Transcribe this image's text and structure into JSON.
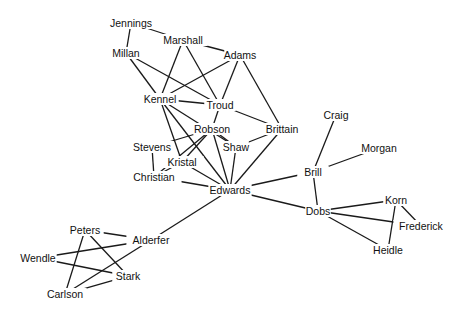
{
  "diagram": {
    "type": "social-network-graph",
    "nodes": [
      {
        "id": "Jennings",
        "label": "Jennings",
        "x": 131,
        "y": 23
      },
      {
        "id": "Marshall",
        "label": "Marshall",
        "x": 183,
        "y": 40
      },
      {
        "id": "Millan",
        "label": "Millan",
        "x": 126,
        "y": 53
      },
      {
        "id": "Adams",
        "label": "Adams",
        "x": 240,
        "y": 55
      },
      {
        "id": "Kennel",
        "label": "Kennel",
        "x": 160,
        "y": 99
      },
      {
        "id": "Troud",
        "label": "Troud",
        "x": 220,
        "y": 105
      },
      {
        "id": "Robson",
        "label": "Robson",
        "x": 212,
        "y": 129
      },
      {
        "id": "Brittain",
        "label": "Brittain",
        "x": 282,
        "y": 129
      },
      {
        "id": "Stevens",
        "label": "Stevens",
        "x": 152,
        "y": 147
      },
      {
        "id": "Shaw",
        "label": "Shaw",
        "x": 236,
        "y": 147
      },
      {
        "id": "Kristal",
        "label": "Kristal",
        "x": 182,
        "y": 162
      },
      {
        "id": "Christian",
        "label": "Christian",
        "x": 154,
        "y": 177
      },
      {
        "id": "Edwards",
        "label": "Edwards",
        "x": 230,
        "y": 190
      },
      {
        "id": "Craig",
        "label": "Craig",
        "x": 336,
        "y": 115
      },
      {
        "id": "Morgan",
        "label": "Morgan",
        "x": 379,
        "y": 148
      },
      {
        "id": "Brill",
        "label": "Brill",
        "x": 313,
        "y": 172
      },
      {
        "id": "Dobs",
        "label": "Dobs",
        "x": 318,
        "y": 211
      },
      {
        "id": "Korn",
        "label": "Korn",
        "x": 396,
        "y": 200
      },
      {
        "id": "Frederick",
        "label": "Frederick",
        "x": 421,
        "y": 226
      },
      {
        "id": "Heidle",
        "label": "Heidle",
        "x": 388,
        "y": 250
      },
      {
        "id": "Peters",
        "label": "Peters",
        "x": 85,
        "y": 230
      },
      {
        "id": "Alderfer",
        "label": "Alderfer",
        "x": 151,
        "y": 240
      },
      {
        "id": "Wendle",
        "label": "Wendle",
        "x": 38,
        "y": 258
      },
      {
        "id": "Stark",
        "label": "Stark",
        "x": 128,
        "y": 276
      },
      {
        "id": "Carlson",
        "label": "Carlson",
        "x": 65,
        "y": 294
      }
    ],
    "edges": [
      [
        "Jennings",
        "Marshall"
      ],
      [
        "Jennings",
        "Millan"
      ],
      [
        "Marshall",
        "Adams"
      ],
      [
        "Marshall",
        "Kennel"
      ],
      [
        "Marshall",
        "Troud"
      ],
      [
        "Millan",
        "Kennel"
      ],
      [
        "Millan",
        "Troud"
      ],
      [
        "Adams",
        "Kennel"
      ],
      [
        "Adams",
        "Troud"
      ],
      [
        "Adams",
        "Brittain"
      ],
      [
        "Kennel",
        "Troud"
      ],
      [
        "Kennel",
        "Kristal"
      ],
      [
        "Kennel",
        "Edwards"
      ],
      [
        "Kennel",
        "Shaw"
      ],
      [
        "Troud",
        "Robson"
      ],
      [
        "Troud",
        "Brittain"
      ],
      [
        "Robson",
        "Stevens"
      ],
      [
        "Robson",
        "Christian"
      ],
      [
        "Robson",
        "Kristal"
      ],
      [
        "Robson",
        "Shaw"
      ],
      [
        "Robson",
        "Edwards"
      ],
      [
        "Brittain",
        "Shaw"
      ],
      [
        "Brittain",
        "Edwards"
      ],
      [
        "Stevens",
        "Christian"
      ],
      [
        "Shaw",
        "Edwards"
      ],
      [
        "Kristal",
        "Christian"
      ],
      [
        "Kristal",
        "Edwards"
      ],
      [
        "Christian",
        "Edwards"
      ],
      [
        "Edwards",
        "Brill"
      ],
      [
        "Edwards",
        "Dobs"
      ],
      [
        "Edwards",
        "Alderfer"
      ],
      [
        "Brill",
        "Craig"
      ],
      [
        "Brill",
        "Morgan"
      ],
      [
        "Brill",
        "Dobs"
      ],
      [
        "Dobs",
        "Korn"
      ],
      [
        "Dobs",
        "Frederick"
      ],
      [
        "Dobs",
        "Heidle"
      ],
      [
        "Korn",
        "Frederick"
      ],
      [
        "Korn",
        "Heidle"
      ],
      [
        "Peters",
        "Alderfer"
      ],
      [
        "Peters",
        "Stark"
      ],
      [
        "Peters",
        "Carlson"
      ],
      [
        "Alderfer",
        "Wendle"
      ],
      [
        "Alderfer",
        "Carlson"
      ],
      [
        "Wendle",
        "Stark"
      ],
      [
        "Stark",
        "Carlson"
      ]
    ],
    "colors": {
      "background": "#ffffff",
      "edge": "#1a1a1a",
      "text": "#111111"
    }
  }
}
